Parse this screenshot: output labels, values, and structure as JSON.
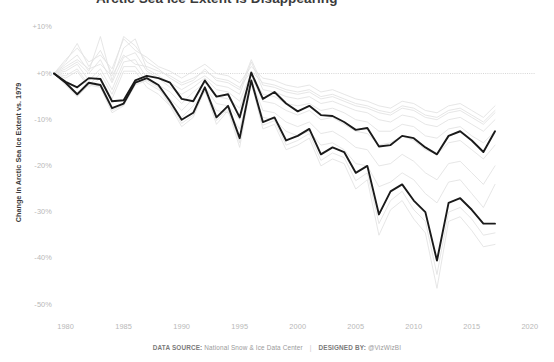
{
  "title": "Arctic Sea Ice Extent Is Disappearing",
  "footer": {
    "source_label": "DATA SOURCE:",
    "source_value": "National Snow & Ice Data Center",
    "separator": "|",
    "designer_label": "DESIGNED BY:",
    "designer_value": "@VizWizBI"
  },
  "colors": {
    "background": "#ffffff",
    "highlight_line": "#1a1a1a",
    "context_line": "#e2e2e2",
    "zero_line": "#c4c4c4",
    "tick_text": "#b8b8b8",
    "axis_title": "#3b3b3b"
  },
  "chart_data": {
    "type": "line",
    "title": "Arctic Sea Ice Extent Is Disappearing",
    "xlabel": "",
    "ylabel": "Change in Arctic Sea Ice Extent vs. 1979",
    "xlim": [
      1978.2,
      2021.5
    ],
    "ylim": [
      -53,
      11
    ],
    "grid": false,
    "legend": "none",
    "x_ticks": [
      1980,
      1985,
      1990,
      1995,
      2000,
      2005,
      2010,
      2015,
      2020
    ],
    "y_ticks": [
      10,
      0,
      -10,
      -20,
      -30,
      -40,
      -50
    ],
    "y_tick_labels": [
      "+10%",
      "+0%",
      "-10%",
      "-20%",
      "-30%",
      "-40%",
      "-50%"
    ],
    "annotations": [
      {
        "type": "reference_line",
        "value": 0,
        "label": "+0% baseline (1979)",
        "style": "dotted",
        "x_start": 1979,
        "x_end": 2020.5
      }
    ],
    "x": [
      1979,
      1980,
      1981,
      1982,
      1983,
      1984,
      1985,
      1986,
      1987,
      1988,
      1989,
      1990,
      1991,
      1992,
      1993,
      1994,
      1995,
      1996,
      1997,
      1998,
      1999,
      2000,
      2001,
      2002,
      2003,
      2004,
      2005,
      2006,
      2007,
      2008,
      2009,
      2010,
      2011,
      2012,
      2013,
      2014,
      2015,
      2016,
      2017
    ],
    "series": [
      {
        "name": "Highlighted month A (annual minimum trend)",
        "emphasis": "bold",
        "color": "#1a1a1a",
        "values": [
          0,
          -1.8,
          -3.0,
          -1.0,
          -1.2,
          -6.0,
          -5.8,
          -1.5,
          -0.5,
          -1.0,
          -2.0,
          -5.5,
          -6.0,
          -1.5,
          -5.0,
          -4.5,
          -9.5,
          0.2,
          -5.5,
          -4.0,
          -6.5,
          -8.2,
          -7.0,
          -9.0,
          -9.2,
          -10.5,
          -12.2,
          -11.8,
          -15.8,
          -15.5,
          -13.5,
          -14.0,
          -16.0,
          -17.5,
          -13.5,
          -12.5,
          -14.5,
          -17.0,
          -12.5
        ]
      },
      {
        "name": "Highlighted month B (September minimum)",
        "emphasis": "bold",
        "color": "#1a1a1a",
        "values": [
          0,
          -2.0,
          -4.5,
          -2.0,
          -2.5,
          -7.5,
          -6.5,
          -2.0,
          -1.0,
          -2.5,
          -6.0,
          -10.0,
          -8.5,
          -3.0,
          -9.5,
          -7.0,
          -14.0,
          -1.5,
          -10.5,
          -9.5,
          -14.5,
          -13.5,
          -12.0,
          -17.5,
          -16.0,
          -17.0,
          -21.5,
          -20.0,
          -30.5,
          -25.5,
          -24.0,
          -27.5,
          -30.0,
          -40.5,
          -28.0,
          -27.0,
          -29.5,
          -32.5,
          -32.5
        ]
      },
      {
        "name": "Context month 01",
        "emphasis": "faint",
        "color": "#e2e2e2",
        "values": [
          0,
          1.5,
          3.0,
          1.0,
          2.0,
          -0.5,
          4.0,
          2.0,
          1.5,
          0.5,
          -0.5,
          -2.0,
          -1.0,
          0.5,
          -1.0,
          -1.5,
          -3.0,
          0.5,
          -2.0,
          -2.5,
          -3.5,
          -4.0,
          -3.5,
          -5.0,
          -4.5,
          -5.5,
          -6.5,
          -7.0,
          -8.0,
          -8.5,
          -7.0,
          -7.5,
          -9.0,
          -9.5,
          -8.0,
          -7.5,
          -9.0,
          -10.5,
          -8.0
        ]
      },
      {
        "name": "Context month 02",
        "emphasis": "faint",
        "color": "#e2e2e2",
        "values": [
          0,
          3.0,
          5.5,
          2.5,
          4.0,
          1.0,
          7.5,
          5.0,
          3.5,
          1.5,
          0.5,
          -1.0,
          0.5,
          2.0,
          0.0,
          -0.5,
          -2.0,
          1.5,
          -1.0,
          -1.5,
          -2.5,
          -3.0,
          -2.5,
          -4.0,
          -3.5,
          -4.5,
          -5.5,
          -6.0,
          -7.0,
          -7.5,
          -6.0,
          -6.5,
          -8.0,
          -8.5,
          -7.0,
          -6.5,
          -8.0,
          -9.5,
          -7.0
        ]
      },
      {
        "name": "Context month 03",
        "emphasis": "faint",
        "color": "#e2e2e2",
        "values": [
          0,
          2.0,
          4.0,
          0.5,
          8.0,
          -1.5,
          5.5,
          7.5,
          1.0,
          -0.5,
          -2.0,
          -3.5,
          -2.0,
          -0.5,
          -2.5,
          -3.0,
          -4.5,
          2.5,
          -3.5,
          -4.0,
          -5.0,
          -5.5,
          -5.0,
          -6.5,
          -6.0,
          -7.0,
          -8.0,
          -8.5,
          -10.0,
          -10.5,
          -9.0,
          -9.5,
          -11.0,
          -11.5,
          -10.0,
          -9.5,
          -11.0,
          -12.5,
          -10.0
        ]
      },
      {
        "name": "Context month 04",
        "emphasis": "faint",
        "color": "#e2e2e2",
        "values": [
          0,
          0.5,
          2.0,
          -1.5,
          1.0,
          -3.5,
          2.5,
          3.0,
          -1.0,
          -2.5,
          -4.0,
          -6.5,
          -4.0,
          -2.0,
          -5.0,
          -5.5,
          -7.5,
          -0.5,
          -6.0,
          -6.5,
          -8.0,
          -9.0,
          -8.0,
          -10.0,
          -9.5,
          -11.0,
          -12.5,
          -13.0,
          -15.5,
          -15.0,
          -13.5,
          -14.5,
          -16.5,
          -17.5,
          -15.0,
          -14.5,
          -16.5,
          -18.5,
          -15.5
        ]
      },
      {
        "name": "Context month 05",
        "emphasis": "faint",
        "color": "#e2e2e2",
        "values": [
          0,
          -0.5,
          1.0,
          -2.5,
          0.0,
          -4.5,
          1.5,
          1.5,
          -2.0,
          -3.5,
          -5.5,
          -8.0,
          -5.5,
          -3.0,
          -6.5,
          -7.0,
          -10.0,
          -1.5,
          -8.0,
          -8.5,
          -10.5,
          -11.5,
          -10.5,
          -13.0,
          -12.5,
          -14.0,
          -16.0,
          -16.5,
          -20.0,
          -19.5,
          -17.5,
          -19.0,
          -21.5,
          -23.0,
          -19.5,
          -19.0,
          -21.5,
          -24.0,
          -20.0
        ]
      },
      {
        "name": "Context month 06",
        "emphasis": "faint",
        "color": "#e2e2e2",
        "values": [
          0,
          -1.0,
          0.5,
          -3.0,
          -1.0,
          -5.5,
          0.5,
          0.5,
          -3.0,
          -4.5,
          -7.0,
          -9.5,
          -7.0,
          -4.0,
          -8.0,
          -8.5,
          -12.0,
          -2.5,
          -9.5,
          -10.0,
          -12.5,
          -13.5,
          -12.5,
          -15.5,
          -15.0,
          -16.5,
          -19.5,
          -20.0,
          -24.5,
          -23.5,
          -21.5,
          -23.0,
          -26.0,
          -28.0,
          -23.5,
          -23.0,
          -26.0,
          -29.0,
          -24.0
        ]
      },
      {
        "name": "Context month 07",
        "emphasis": "faint",
        "color": "#e2e2e2",
        "values": [
          0,
          -2.5,
          -5.0,
          -2.5,
          -3.0,
          -8.5,
          -7.0,
          -2.5,
          -1.5,
          -3.0,
          -7.0,
          -11.5,
          -9.5,
          -3.5,
          -11.0,
          -8.0,
          -16.0,
          -2.0,
          -12.0,
          -11.0,
          -16.5,
          -15.5,
          -14.0,
          -20.0,
          -18.5,
          -19.5,
          -25.0,
          -23.0,
          -35.0,
          -29.5,
          -27.5,
          -31.5,
          -34.5,
          -46.5,
          -32.0,
          -31.0,
          -34.0,
          -37.5,
          -37.0
        ]
      },
      {
        "name": "Context month 08",
        "emphasis": "faint",
        "color": "#e2e2e2",
        "values": [
          0,
          -2.2,
          -4.8,
          -2.2,
          -2.8,
          -8.0,
          -6.8,
          -2.2,
          -1.2,
          -2.8,
          -6.5,
          -10.8,
          -9.0,
          -3.2,
          -10.2,
          -7.5,
          -15.0,
          -1.8,
          -11.2,
          -10.2,
          -15.5,
          -14.5,
          -13.0,
          -18.8,
          -17.2,
          -18.2,
          -23.2,
          -21.5,
          -32.5,
          -27.5,
          -25.5,
          -29.5,
          -32.0,
          -43.5,
          -30.0,
          -29.0,
          -31.5,
          -35.0,
          -34.5
        ]
      },
      {
        "name": "Context month 09",
        "emphasis": "faint",
        "color": "#e2e2e2",
        "values": [
          0,
          2.5,
          6.5,
          1.5,
          5.0,
          0.0,
          8.0,
          6.0,
          2.5,
          1.0,
          -1.0,
          -2.5,
          -1.5,
          1.0,
          -1.5,
          -2.0,
          -3.5,
          3.0,
          -2.5,
          -3.0,
          -4.0,
          -4.5,
          -4.0,
          -5.5,
          -5.0,
          -6.0,
          -7.0,
          -7.5,
          -8.5,
          -9.0,
          -7.5,
          -8.0,
          -9.5,
          -10.0,
          -8.5,
          -8.0,
          -9.5,
          -11.0,
          -8.5
        ]
      },
      {
        "name": "Context month 10",
        "emphasis": "faint",
        "color": "#e2e2e2",
        "values": [
          0,
          1.0,
          2.5,
          0.0,
          3.0,
          -2.0,
          3.5,
          4.5,
          0.5,
          -1.0,
          -3.0,
          -4.5,
          -3.0,
          -1.0,
          -3.5,
          -4.0,
          -6.0,
          0.0,
          -4.5,
          -5.0,
          -6.5,
          -7.0,
          -6.5,
          -8.0,
          -7.5,
          -8.5,
          -10.0,
          -10.5,
          -12.5,
          -12.5,
          -11.0,
          -11.5,
          -13.5,
          -14.0,
          -12.0,
          -11.5,
          -13.5,
          -15.0,
          -12.5
        ]
      }
    ]
  }
}
